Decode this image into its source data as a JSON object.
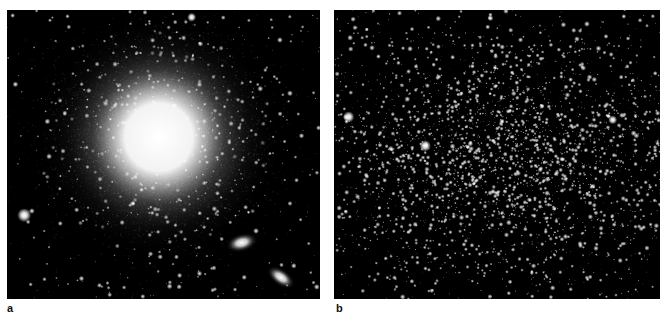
{
  "figure": {
    "panels": [
      {
        "label": "a",
        "subject": "giant elliptical galaxy with two small companion galaxies",
        "background": "#000000",
        "features": [
          {
            "type": "elliptical-halo",
            "cx": 0.485,
            "cy": 0.44,
            "core_r": 0.15,
            "halo_r": 0.42,
            "color": "#ffffff"
          },
          {
            "type": "companion-galaxy",
            "cx": 0.75,
            "cy": 0.805,
            "rx": 0.035,
            "ry": 0.02,
            "angle": -15
          },
          {
            "type": "companion-galaxy",
            "cx": 0.875,
            "cy": 0.925,
            "rx": 0.035,
            "ry": 0.018,
            "angle": 35
          },
          {
            "type": "bright-star",
            "cx": 0.055,
            "cy": 0.71,
            "r": 0.011
          },
          {
            "type": "bright-star",
            "cx": 0.59,
            "cy": 0.025,
            "r": 0.007
          }
        ],
        "field_star_count": 420,
        "seed": 11
      },
      {
        "label": "b",
        "subject": "resolved dwarf spheroidal galaxy star field",
        "background": "#000000",
        "features": [
          {
            "type": "star-cloud",
            "cx": 0.53,
            "cy": 0.5,
            "sx": 0.3,
            "sy": 0.22,
            "count": 2600
          },
          {
            "type": "bright-star",
            "cx": 0.045,
            "cy": 0.37,
            "r": 0.009
          },
          {
            "type": "bright-star",
            "cx": 0.28,
            "cy": 0.47,
            "r": 0.009
          },
          {
            "type": "bright-star",
            "cx": 0.855,
            "cy": 0.38,
            "r": 0.007
          }
        ],
        "field_star_count": 700,
        "seed": 29
      }
    ]
  }
}
